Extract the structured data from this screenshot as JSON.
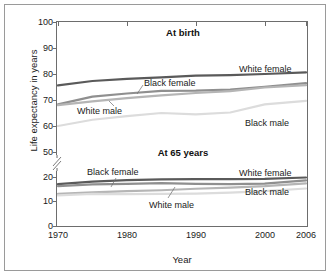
{
  "chart_data": {
    "type": "line",
    "title": "",
    "xlabel": "Year",
    "ylabel": "Life expectancy in years",
    "x": [
      1970,
      1975,
      1980,
      1985,
      1990,
      1995,
      2000,
      2006
    ],
    "xlim": [
      1970,
      2006
    ],
    "xticks": [
      "1970",
      "1980",
      "1990",
      "2000",
      "2006"
    ],
    "yticks": [
      "0",
      "10",
      "20",
      "50",
      "60",
      "70",
      "80",
      "90",
      "100"
    ],
    "ylim": [
      0,
      100
    ],
    "axis_break": "between 20 and 50",
    "grid": false,
    "legend_position": "inline labels on lines",
    "panels": [
      {
        "name": "At birth",
        "series": [
          {
            "name": "White female",
            "color": "#5a5a5a",
            "values": [
              75.6,
              77.3,
              78.1,
              78.7,
              79.4,
              79.6,
              80.0,
              80.6
            ]
          },
          {
            "name": "Black female",
            "color": "#8f8f8f",
            "values": [
              68.3,
              71.3,
              72.5,
              73.5,
              73.6,
              74.0,
              75.1,
              76.5
            ]
          },
          {
            "name": "White male",
            "color": "#b5b5b5",
            "values": [
              68.0,
              69.5,
              70.7,
              71.8,
              72.7,
              73.4,
              74.8,
              75.7
            ]
          },
          {
            "name": "Black male",
            "color": "#dcdcdc",
            "values": [
              60.0,
              62.4,
              63.8,
              65.0,
              64.5,
              65.2,
              68.3,
              69.7
            ]
          }
        ]
      },
      {
        "name": "At 65 years",
        "series": [
          {
            "name": "White female",
            "color": "#5a5a5a",
            "values": [
              17.1,
              18.1,
              18.7,
              19.0,
              19.1,
              19.1,
              19.2,
              19.8
            ]
          },
          {
            "name": "Black female",
            "color": "#8f8f8f",
            "values": [
              16.3,
              17.0,
              17.2,
              17.5,
              17.2,
              17.1,
              17.3,
              18.6
            ]
          },
          {
            "name": "White male",
            "color": "#b5b5b5",
            "values": [
              13.1,
              13.7,
              14.2,
              14.6,
              15.2,
              15.7,
              16.3,
              17.4
            ]
          },
          {
            "name": "Black male",
            "color": "#dcdcdc",
            "values": [
              12.5,
              13.1,
              13.0,
              13.1,
              13.2,
              13.6,
              14.2,
              15.3
            ]
          }
        ]
      }
    ],
    "annotations": [
      {
        "text": "At birth",
        "panel": "At birth"
      },
      {
        "text": "At 65 years",
        "panel": "At 65 years"
      },
      {
        "text": "White female",
        "panel": "At birth"
      },
      {
        "text": "Black female",
        "panel": "At birth"
      },
      {
        "text": "White male",
        "panel": "At birth"
      },
      {
        "text": "Black male",
        "panel": "At birth"
      },
      {
        "text": "White female",
        "panel": "At 65 years"
      },
      {
        "text": "Black female",
        "panel": "At 65 years"
      },
      {
        "text": "White male",
        "panel": "At 65 years"
      },
      {
        "text": "Black male",
        "panel": "At 65 years"
      }
    ]
  },
  "axis": {
    "ylabel": "Life expectancy in years",
    "xlabel": "Year",
    "y": {
      "t100": "100",
      "t90": "90",
      "t80": "80",
      "t70": "70",
      "t60": "60",
      "t50": "50",
      "t20": "20",
      "t10": "10",
      "t0": "0"
    },
    "x": {
      "t1970": "1970",
      "t1980": "1980",
      "t1990": "1990",
      "t2000": "2000",
      "t2006": "2006"
    }
  },
  "panels": {
    "birth": {
      "title": "At birth"
    },
    "age65": {
      "title": "At 65 years"
    }
  },
  "labels": {
    "birth_white_female": "White female",
    "birth_black_female": "Black female",
    "birth_white_male": "White male",
    "birth_black_male": "Black male",
    "age65_white_female": "White female",
    "age65_black_female": "Black female",
    "age65_white_male": "White male",
    "age65_black_male": "Black male"
  },
  "colors": {
    "white_female": "#5a5a5a",
    "black_female": "#8f8f8f",
    "white_male": "#b5b5b5",
    "black_male": "#dcdcdc",
    "axis": "#6d6d6d",
    "frame": "#9a9a9a",
    "text": "#1a1a1a"
  }
}
